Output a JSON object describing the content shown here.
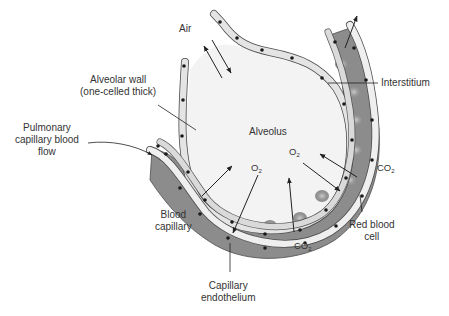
{
  "figure": {
    "colors": {
      "background": "#ffffff",
      "alveolus_fill": "#f2f2f2",
      "epithelial_cell": "#d9d9d9",
      "epithelial_cell_light": "#f0f0f0",
      "capillary_fill": "#8c8c8c",
      "red_blood_cell": "#a6a6a6",
      "nucleus": "#1a1a1a",
      "outline": "#4d4d4d",
      "label_text": "#333333"
    }
  },
  "labels": {
    "air": "Air",
    "alveolar_wall_line1": "Alveolar wall",
    "alveolar_wall_line2": "(one-celled thick)",
    "pulmonary_line1": "Pulmonary",
    "pulmonary_line2": "capillary blood",
    "pulmonary_line3": "flow",
    "interstitium": "Interstitium",
    "alveolus": "Alveolus",
    "blood_capillary_line1": "Blood",
    "blood_capillary_line2": "capillary",
    "red_blood_cell_line1": "Red blood",
    "red_blood_cell_line2": "cell",
    "capillary_endothelium_line1": "Capillary",
    "capillary_endothelium_line2": "endothelium"
  },
  "molecules": {
    "o2_center": {
      "base": "O",
      "sub": "2"
    },
    "o2_right": {
      "base": "O",
      "sub": "2"
    },
    "co2_right": {
      "base": "CO",
      "sub": "2"
    },
    "co2_bottom": {
      "base": "CO",
      "sub": "2"
    }
  }
}
